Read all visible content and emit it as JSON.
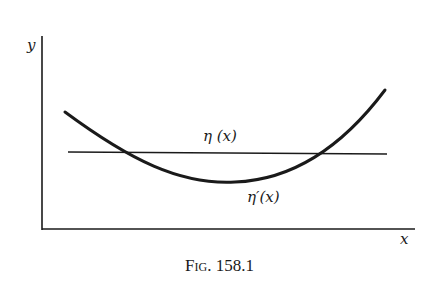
{
  "figure": {
    "axis_y_label": "y",
    "axis_x_label": "x",
    "curve_labels": {
      "line": "η (x)",
      "curve": "η′(x)"
    },
    "caption": {
      "prefix": "Fig.",
      "number": "158.1"
    },
    "colors": {
      "ink": "#1a1a1a",
      "background": "#ffffff"
    }
  }
}
